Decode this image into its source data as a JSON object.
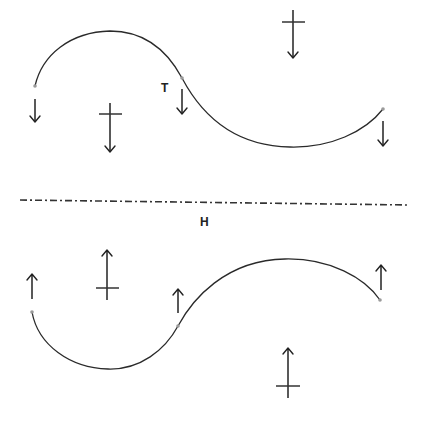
{
  "diagram": {
    "labels": {
      "tangent_label": "T",
      "axis_label": "H"
    },
    "colors": {
      "line": "#2a2a2a",
      "background": "#ffffff",
      "point": "#9a9a9a"
    },
    "axis": {
      "style": "dash-dot",
      "y": 201,
      "x_start": 20,
      "x_end": 410
    },
    "curves": [
      {
        "name": "upper-s-curve",
        "start": [
          35,
          86
        ],
        "peak": [
          110,
          31
        ],
        "inflection": [
          182,
          78
        ],
        "trough": [
          300,
          147
        ],
        "end": [
          383,
          109
        ]
      },
      {
        "name": "lower-s-curve",
        "start": [
          32,
          312
        ],
        "trough": [
          108,
          369
        ],
        "inflection": [
          178,
          326
        ],
        "peak": [
          285,
          259
        ],
        "end": [
          380,
          300
        ]
      }
    ],
    "arrows": {
      "upper": [
        {
          "name": "left-end-arrow",
          "direction": "down",
          "crossbar": false
        },
        {
          "name": "left-cross-arrow",
          "direction": "down",
          "crossbar": true
        },
        {
          "name": "tangent-arrow",
          "direction": "down",
          "crossbar": false
        },
        {
          "name": "top-cross-arrow",
          "direction": "down",
          "crossbar": true
        },
        {
          "name": "right-end-arrow",
          "direction": "down",
          "crossbar": false
        }
      ],
      "lower": [
        {
          "name": "left-end-arrow",
          "direction": "up",
          "crossbar": false
        },
        {
          "name": "left-cross-arrow",
          "direction": "up",
          "crossbar": true
        },
        {
          "name": "inflection-arrow",
          "direction": "up",
          "crossbar": false
        },
        {
          "name": "right-end-arrow",
          "direction": "up",
          "crossbar": false
        },
        {
          "name": "bottom-cross-arrow",
          "direction": "up",
          "crossbar": true
        }
      ]
    }
  }
}
